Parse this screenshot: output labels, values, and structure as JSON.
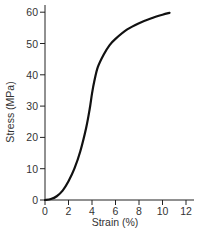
{
  "chart_data": {
    "type": "line",
    "title": "",
    "xlabel": "Strain (%)",
    "ylabel": "Stress (MPa)",
    "xlim": [
      0,
      13
    ],
    "ylim": [
      0,
      62
    ],
    "xticks": [
      0,
      2,
      4,
      6,
      8,
      10,
      12
    ],
    "yticks": [
      0,
      10,
      20,
      30,
      40,
      50,
      60
    ],
    "grid": false,
    "legend": null,
    "series": [
      {
        "name": "Stress-strain curve",
        "color": "#111111",
        "x": [
          0,
          0.5,
          1.0,
          1.5,
          2.0,
          2.5,
          3.0,
          3.5,
          3.8,
          4.0,
          4.2,
          4.5,
          5.0,
          5.5,
          6.0,
          7.0,
          8.0,
          9.0,
          10.0,
          10.6
        ],
        "y": [
          0,
          0.3,
          1.2,
          3.0,
          6.0,
          10.0,
          15.5,
          23.0,
          29.0,
          34.0,
          38.0,
          42.5,
          46.5,
          49.5,
          51.5,
          54.5,
          56.5,
          58.0,
          59.2,
          59.8
        ]
      }
    ]
  }
}
